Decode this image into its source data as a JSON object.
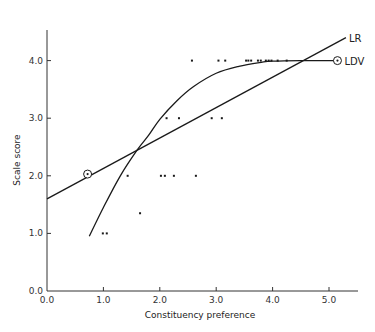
{
  "chart_data": {
    "type": "scatter",
    "title": "",
    "xlabel": "Constituency preference",
    "ylabel": "Scale score",
    "xlim": [
      0.0,
      5.5
    ],
    "ylim": [
      0.0,
      4.6
    ],
    "x_ticks": [
      "0.0",
      "1.0",
      "2.0",
      "3.0",
      "4.0",
      "5.0"
    ],
    "y_ticks": [
      "0.0",
      "1.0",
      "2.0",
      "3.0",
      "4.0"
    ],
    "grid": false,
    "legend": "inline labels at line ends",
    "points": [
      {
        "x": 0.99,
        "y": 1.0
      },
      {
        "x": 1.06,
        "y": 1.0
      },
      {
        "x": 1.65,
        "y": 1.35
      },
      {
        "x": 1.43,
        "y": 2.0
      },
      {
        "x": 2.02,
        "y": 2.0
      },
      {
        "x": 2.09,
        "y": 2.0
      },
      {
        "x": 2.25,
        "y": 2.0
      },
      {
        "x": 2.64,
        "y": 2.0
      },
      {
        "x": 2.12,
        "y": 3.0
      },
      {
        "x": 2.34,
        "y": 3.0
      },
      {
        "x": 2.92,
        "y": 3.0
      },
      {
        "x": 3.1,
        "y": 3.0
      },
      {
        "x": 2.57,
        "y": 4.0
      },
      {
        "x": 3.04,
        "y": 4.0
      },
      {
        "x": 3.16,
        "y": 4.0
      },
      {
        "x": 3.53,
        "y": 4.0
      },
      {
        "x": 3.57,
        "y": 4.0
      },
      {
        "x": 3.62,
        "y": 4.0
      },
      {
        "x": 3.74,
        "y": 4.0
      },
      {
        "x": 3.79,
        "y": 4.0
      },
      {
        "x": 3.88,
        "y": 4.0
      },
      {
        "x": 3.93,
        "y": 4.0
      },
      {
        "x": 3.98,
        "y": 4.0
      },
      {
        "x": 4.09,
        "y": 4.0
      },
      {
        "x": 4.25,
        "y": 4.0
      }
    ],
    "series": [
      {
        "name": "LR",
        "kind": "linear regression line",
        "x": [
          0.0,
          5.3
        ],
        "y": [
          1.6,
          4.4
        ],
        "marker_point": {
          "x": 0.72,
          "y": 2.03
        }
      },
      {
        "name": "LDV",
        "kind": "limited dependent variable curve",
        "x": [
          0.75,
          1.0,
          1.3,
          1.6,
          1.8,
          2.0,
          2.3,
          2.6,
          3.0,
          3.4,
          3.8,
          4.0,
          4.5,
          5.15
        ],
        "y": [
          0.95,
          1.45,
          2.0,
          2.45,
          2.7,
          2.98,
          3.3,
          3.55,
          3.78,
          3.9,
          3.97,
          3.99,
          4.0,
          4.0
        ],
        "marker_point": {
          "x": 5.15,
          "y": 4.0
        }
      }
    ]
  }
}
